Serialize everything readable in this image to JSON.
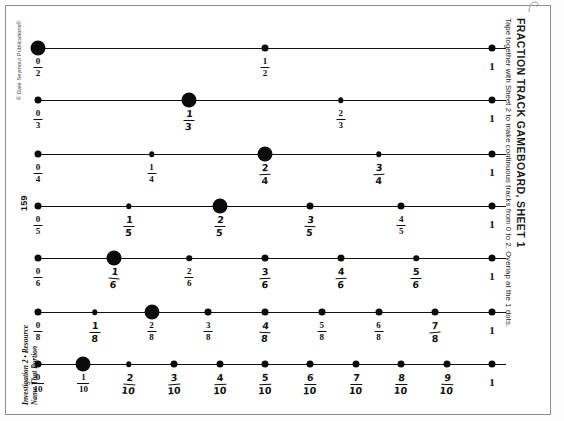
{
  "document": {
    "title": "FRACTION TRACK GAMEBOARD, SHEET 1",
    "subtitle": "Tape together with Sheet 2 to make continuous tracks from 0 to 2. Overlap at the 1 dots.",
    "copyright": "© Dale Seymour Publications®",
    "page_number": "159",
    "footer_line1": "Investigation 2 • Resource",
    "footer_line2": "Name That Portion",
    "whole_label": "1"
  },
  "colors": {
    "ink": "#0b0b0b",
    "paper": "#ffffff",
    "frame": "#8d8d8d"
  },
  "tracks": [
    {
      "name": "halves",
      "denominator": 2,
      "marked_index": 0,
      "ticks": [
        {
          "numerator": "0",
          "denominator": "2",
          "value": 0,
          "size": "big",
          "style": "print"
        },
        {
          "numerator": "1",
          "denominator": "2",
          "value": 0.5,
          "size": "small",
          "style": "print"
        },
        {
          "numerator": "1",
          "denominator": "",
          "value": 1,
          "size": "small",
          "style": "whole"
        }
      ]
    },
    {
      "name": "thirds",
      "denominator": 3,
      "marked_index": 1,
      "ticks": [
        {
          "numerator": "0",
          "denominator": "3",
          "value": 0,
          "size": "small",
          "style": "print"
        },
        {
          "numerator": "1",
          "denominator": "3",
          "value": 0.3333,
          "size": "big",
          "style": "hand"
        },
        {
          "numerator": "2",
          "denominator": "3",
          "value": 0.6667,
          "size": "tiny",
          "style": "print"
        },
        {
          "numerator": "1",
          "denominator": "",
          "value": 1,
          "size": "small",
          "style": "whole"
        }
      ]
    },
    {
      "name": "fourths",
      "denominator": 4,
      "marked_index": 2,
      "ticks": [
        {
          "numerator": "0",
          "denominator": "4",
          "value": 0,
          "size": "small",
          "style": "print"
        },
        {
          "numerator": "1",
          "denominator": "4",
          "value": 0.25,
          "size": "tiny",
          "style": "print"
        },
        {
          "numerator": "2",
          "denominator": "4",
          "value": 0.5,
          "size": "big",
          "style": "hand"
        },
        {
          "numerator": "3",
          "denominator": "4",
          "value": 0.75,
          "size": "tiny",
          "style": "hand"
        },
        {
          "numerator": "1",
          "denominator": "",
          "value": 1,
          "size": "small",
          "style": "whole"
        }
      ]
    },
    {
      "name": "fifths",
      "denominator": 5,
      "marked_index": 2,
      "ticks": [
        {
          "numerator": "0",
          "denominator": "5",
          "value": 0,
          "size": "small",
          "style": "print"
        },
        {
          "numerator": "1",
          "denominator": "5",
          "value": 0.2,
          "size": "tiny",
          "style": "hand"
        },
        {
          "numerator": "2",
          "denominator": "5",
          "value": 0.4,
          "size": "big",
          "style": "hand"
        },
        {
          "numerator": "3",
          "denominator": "5",
          "value": 0.6,
          "size": "small",
          "style": "hand"
        },
        {
          "numerator": "4",
          "denominator": "5",
          "value": 0.8,
          "size": "small",
          "style": "print"
        },
        {
          "numerator": "1",
          "denominator": "",
          "value": 1,
          "size": "small",
          "style": "whole"
        }
      ]
    },
    {
      "name": "sixths",
      "denominator": 6,
      "marked_index": 1,
      "ticks": [
        {
          "numerator": "0",
          "denominator": "6",
          "value": 0,
          "size": "small",
          "style": "print"
        },
        {
          "numerator": "1",
          "denominator": "6",
          "value": 0.1667,
          "size": "big",
          "style": "hand"
        },
        {
          "numerator": "2",
          "denominator": "6",
          "value": 0.3333,
          "size": "tiny",
          "style": "print"
        },
        {
          "numerator": "3",
          "denominator": "6",
          "value": 0.5,
          "size": "small",
          "style": "hand"
        },
        {
          "numerator": "4",
          "denominator": "6",
          "value": 0.6667,
          "size": "small",
          "style": "hand"
        },
        {
          "numerator": "5",
          "denominator": "6",
          "value": 0.8333,
          "size": "tiny",
          "style": "hand"
        },
        {
          "numerator": "1",
          "denominator": "",
          "value": 1,
          "size": "small",
          "style": "whole"
        }
      ]
    },
    {
      "name": "eighths",
      "denominator": 8,
      "marked_index": 2,
      "ticks": [
        {
          "numerator": "0",
          "denominator": "8",
          "value": 0,
          "size": "small",
          "style": "print"
        },
        {
          "numerator": "1",
          "denominator": "8",
          "value": 0.125,
          "size": "tiny",
          "style": "hand"
        },
        {
          "numerator": "2",
          "denominator": "8",
          "value": 0.25,
          "size": "big",
          "style": "print"
        },
        {
          "numerator": "3",
          "denominator": "8",
          "value": 0.375,
          "size": "small",
          "style": "print"
        },
        {
          "numerator": "4",
          "denominator": "8",
          "value": 0.5,
          "size": "small",
          "style": "hand"
        },
        {
          "numerator": "5",
          "denominator": "8",
          "value": 0.625,
          "size": "small",
          "style": "print"
        },
        {
          "numerator": "6",
          "denominator": "8",
          "value": 0.75,
          "size": "small",
          "style": "print"
        },
        {
          "numerator": "7",
          "denominator": "8",
          "value": 0.875,
          "size": "small",
          "style": "hand"
        },
        {
          "numerator": "1",
          "denominator": "",
          "value": 1,
          "size": "small",
          "style": "whole"
        }
      ]
    },
    {
      "name": "tenths",
      "denominator": 10,
      "marked_index": 1,
      "ticks": [
        {
          "numerator": "0",
          "denominator": "10",
          "value": 0,
          "size": "small",
          "style": "print"
        },
        {
          "numerator": "1",
          "denominator": "10",
          "value": 0.1,
          "size": "big",
          "style": "print"
        },
        {
          "numerator": "2",
          "denominator": "10",
          "value": 0.2,
          "size": "tiny",
          "style": "hand"
        },
        {
          "numerator": "3",
          "denominator": "10",
          "value": 0.3,
          "size": "small",
          "style": "hand"
        },
        {
          "numerator": "4",
          "denominator": "10",
          "value": 0.4,
          "size": "small",
          "style": "hand"
        },
        {
          "numerator": "5",
          "denominator": "10",
          "value": 0.5,
          "size": "small",
          "style": "hand"
        },
        {
          "numerator": "6",
          "denominator": "10",
          "value": 0.6,
          "size": "small",
          "style": "hand"
        },
        {
          "numerator": "7",
          "denominator": "10",
          "value": 0.7,
          "size": "small",
          "style": "hand"
        },
        {
          "numerator": "8",
          "denominator": "10",
          "value": 0.8,
          "size": "small",
          "style": "hand"
        },
        {
          "numerator": "9",
          "denominator": "10",
          "value": 0.9,
          "size": "small",
          "style": "hand"
        },
        {
          "numerator": "1",
          "denominator": "",
          "value": 1,
          "size": "small",
          "style": "whole"
        }
      ]
    }
  ],
  "layout": {
    "track_y": [
      48,
      100,
      154,
      206,
      258,
      312,
      364
    ],
    "line_left": 38,
    "line_right": 506,
    "one_x": 492
  }
}
